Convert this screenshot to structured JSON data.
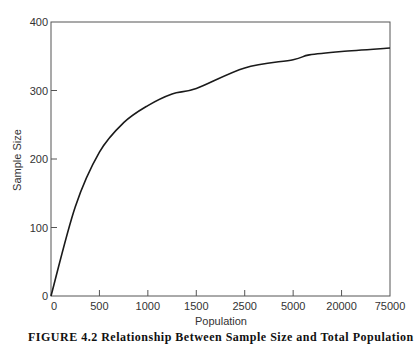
{
  "chart_data": {
    "type": "line",
    "title": "",
    "xlabel": "Population",
    "ylabel": "Sample Size",
    "x_tick_labels": [
      "0",
      "500",
      "1000",
      "1500",
      "2500",
      "5000",
      "20000",
      "75000"
    ],
    "y_tick_labels": [
      "0",
      "100",
      "200",
      "300",
      "400"
    ],
    "ylim": [
      0,
      400
    ],
    "x_scale": "categorical-ordinal (equally spaced ticks)",
    "grid": false,
    "legend": null,
    "series": [
      {
        "name": "Sample Size",
        "x": [
          0,
          250,
          500,
          750,
          1000,
          1250,
          1500,
          2500,
          5000,
          10000,
          20000,
          75000
        ],
        "values": [
          0,
          130,
          210,
          253,
          278,
          295,
          303,
          333,
          345,
          352,
          357,
          362
        ]
      }
    ],
    "caption": "FIGURE 4.2  Relationship Between Sample Size and Total Population"
  },
  "axes": {
    "x_label": "Population",
    "y_label": "Sample Size"
  },
  "colors": {
    "line": "#1a1a1a",
    "axis": "#555555",
    "text": "#333333"
  }
}
